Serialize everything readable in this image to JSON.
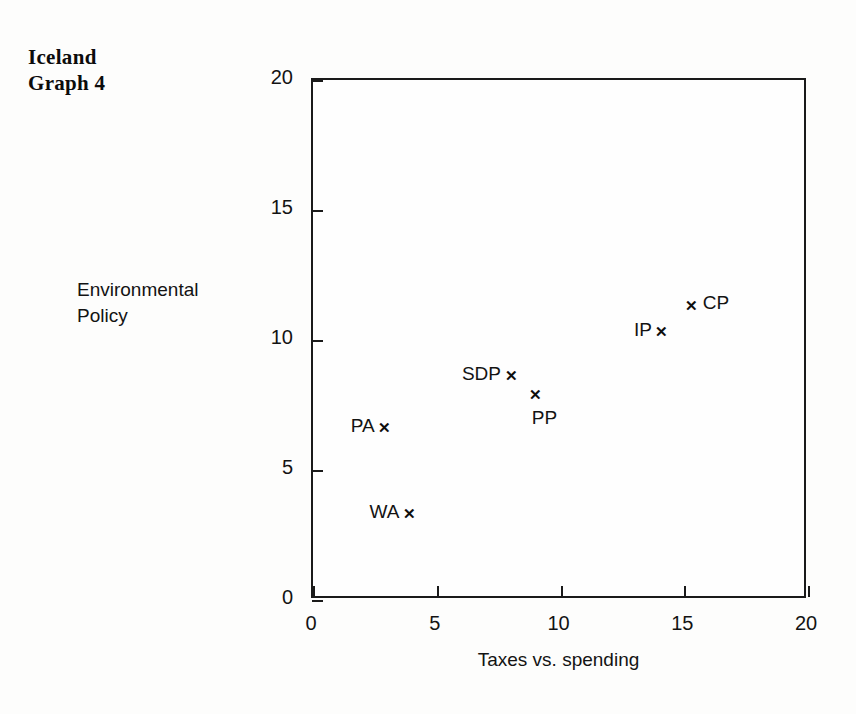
{
  "figure": {
    "title_lines": [
      "Iceland",
      "Graph 4"
    ]
  },
  "chart_data": {
    "type": "scatter",
    "title": "Iceland Graph 4",
    "xlabel": "Taxes vs. spending",
    "ylabel": "Environmental Policy",
    "xlim": [
      0,
      20
    ],
    "ylim": [
      0,
      20
    ],
    "xticks": [
      "0",
      "5",
      "10",
      "15",
      "20"
    ],
    "yticks": [
      "0",
      "5",
      "10",
      "15",
      "20"
    ],
    "grid": false,
    "legend": "none",
    "marker": "x",
    "points": [
      {
        "label": "WA",
        "x": 3.9,
        "y": 3.3,
        "label_pos": "left"
      },
      {
        "label": "PA",
        "x": 2.9,
        "y": 6.6,
        "label_pos": "left"
      },
      {
        "label": "PP",
        "x": 9.0,
        "y": 7.9,
        "label_pos": "below-right"
      },
      {
        "label": "SDP",
        "x": 8.0,
        "y": 8.6,
        "label_pos": "left"
      },
      {
        "label": "IP",
        "x": 14.1,
        "y": 10.3,
        "label_pos": "left"
      },
      {
        "label": "CP",
        "x": 15.3,
        "y": 11.3,
        "label_pos": "right"
      }
    ]
  },
  "colors": {
    "ink": "#111111",
    "background": "#fdfdfc",
    "axis": "#1a1a1a"
  }
}
